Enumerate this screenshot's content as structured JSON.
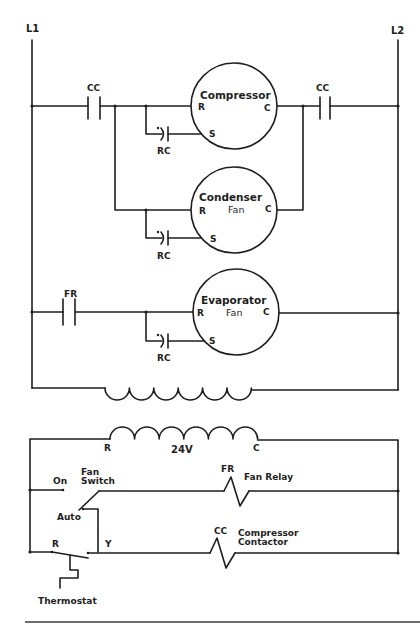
{
  "diagram": {
    "type": "HVAC ladder wiring schematic",
    "power_lines": {
      "left": "L1",
      "right": "L2"
    },
    "high_voltage_section": {
      "contacts": [
        {
          "id": "cc-left",
          "label": "CC"
        },
        {
          "id": "cc-right",
          "label": "CC"
        },
        {
          "id": "fr",
          "label": "FR"
        }
      ],
      "motors": [
        {
          "id": "compressor",
          "name": "Compressor",
          "sub": "",
          "terminals": {
            "run": "R",
            "common": "C",
            "start": "S"
          },
          "capacitor": "RC"
        },
        {
          "id": "condenser",
          "name": "Condenser",
          "sub": "Fan",
          "terminals": {
            "run": "R",
            "common": "C",
            "start": "S"
          },
          "capacitor": "RC"
        },
        {
          "id": "evaporator",
          "name": "Evaporator",
          "sub": "Fan",
          "terminals": {
            "run": "R",
            "common": "C",
            "start": "S"
          },
          "capacitor": "RC"
        }
      ],
      "capacitor_dot": "•"
    },
    "transformer": {
      "secondary_voltage": "24V",
      "secondary_terminals": {
        "left": "R",
        "right": "C"
      }
    },
    "low_voltage_section": {
      "fan_switch": {
        "label": "Fan Switch",
        "label_line1": "Fan",
        "label_line2": "Switch",
        "positions": {
          "on": "On",
          "auto": "Auto"
        }
      },
      "fan_relay": {
        "abbr": "FR",
        "label": "Fan Relay"
      },
      "compressor_contactor": {
        "abbr": "CC",
        "label_line1": "Compressor",
        "label_line2": "Contactor"
      },
      "thermostat": {
        "label": "Thermostat",
        "terminals": {
          "r": "R",
          "y": "Y"
        }
      }
    },
    "colors": {
      "ink": "#1e1e1e",
      "background": "#ffffff",
      "rule": "#6b6b6b"
    }
  }
}
